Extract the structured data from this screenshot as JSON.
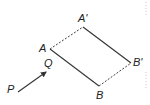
{
  "diagram": {
    "type": "parallelogram-translation",
    "points": {
      "A": {
        "label": "A",
        "x": 50,
        "y": 49
      },
      "A'": {
        "label": "A'",
        "x": 83,
        "y": 27
      },
      "B": {
        "label": "B",
        "x": 99,
        "y": 86
      },
      "B'": {
        "label": "B'",
        "x": 131,
        "y": 63
      },
      "P": {
        "label": "P",
        "x": 18,
        "y": 92
      },
      "Q": {
        "label": "Q",
        "x": 47,
        "y": 71
      }
    },
    "labels": {
      "A": "A",
      "A_prime": "A'",
      "B": "B",
      "B_prime": "B'",
      "P": "P",
      "Q": "Q"
    },
    "segments": [
      {
        "from": "A",
        "to": "B",
        "style": "solid"
      },
      {
        "from": "A'",
        "to": "B'",
        "style": "solid"
      },
      {
        "from": "A",
        "to": "A'",
        "style": "dashed"
      },
      {
        "from": "B",
        "to": "B'",
        "style": "dashed"
      }
    ],
    "vector": {
      "from": "P",
      "to": "Q",
      "style": "arrow"
    },
    "colors": {
      "line": "#333333",
      "text": "#222222",
      "background": "#ffffff"
    }
  }
}
